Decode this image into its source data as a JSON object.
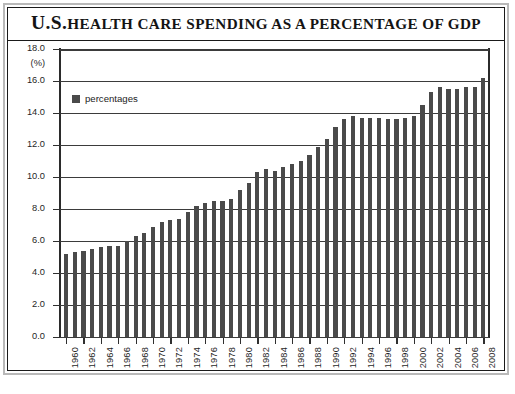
{
  "chart_data": {
    "type": "bar",
    "title_lead": "U.S.",
    "title_rest": "Health Care Spending as a Percentage of GDP",
    "xlabel": "",
    "ylabel": "",
    "yunit": "(%)",
    "ylim": [
      0.0,
      18.0
    ],
    "ytick_labels": [
      "18.0",
      "16.0",
      "14.0",
      "12.0",
      "10.0",
      "8.0",
      "6.0",
      "4.0",
      "2.0",
      "0.0"
    ],
    "ytick_values": [
      18.0,
      16.0,
      14.0,
      12.0,
      10.0,
      8.0,
      6.0,
      4.0,
      2.0,
      0.0
    ],
    "grid": true,
    "legend_position": "upper-left",
    "legend": [
      {
        "name": "percentages",
        "color": "#4a4a4a"
      }
    ],
    "series": [
      {
        "name": "percentages",
        "color": "#4a4a4a",
        "values": [
          5.2,
          5.3,
          5.4,
          5.5,
          5.6,
          5.7,
          5.7,
          6.0,
          6.3,
          6.5,
          6.9,
          7.2,
          7.3,
          7.4,
          7.8,
          8.2,
          8.4,
          8.5,
          8.5,
          8.6,
          9.2,
          9.6,
          10.3,
          10.5,
          10.4,
          10.6,
          10.8,
          11.0,
          11.4,
          11.9,
          12.4,
          13.1,
          13.6,
          13.8,
          13.7,
          13.7,
          13.7,
          13.6,
          13.6,
          13.7,
          13.8,
          14.5,
          15.3,
          15.6,
          15.5,
          15.5,
          15.6,
          15.6,
          16.2
        ],
        "x": [
          1960,
          1961,
          1962,
          1963,
          1964,
          1965,
          1966,
          1967,
          1968,
          1969,
          1970,
          1971,
          1972,
          1973,
          1974,
          1975,
          1976,
          1977,
          1978,
          1979,
          1980,
          1981,
          1982,
          1983,
          1984,
          1985,
          1986,
          1987,
          1988,
          1989,
          1990,
          1991,
          1992,
          1993,
          1994,
          1995,
          1996,
          1997,
          1998,
          1999,
          2000,
          2001,
          2002,
          2003,
          2004,
          2005,
          2006,
          2007,
          2008
        ]
      }
    ],
    "xtick_labels": [
      "1960",
      "1962",
      "1964",
      "1966",
      "1968",
      "1970",
      "1972",
      "1974",
      "1976",
      "1978",
      "1980",
      "1982",
      "1984",
      "1986",
      "1988",
      "1990",
      "1992",
      "1994",
      "1996",
      "1998",
      "2000",
      "2002",
      "2004",
      "2006",
      "2008"
    ]
  }
}
